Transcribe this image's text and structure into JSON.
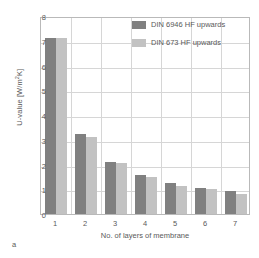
{
  "chart_data": {
    "type": "bar",
    "title": "",
    "categories": [
      "1",
      "2",
      "3",
      "4",
      "5",
      "6",
      "7"
    ],
    "series": [
      {
        "name": "DIN 6946 HF upwards",
        "color": "#808080",
        "values": [
          7.1,
          3.25,
          2.1,
          1.57,
          1.27,
          1.07,
          0.92
        ]
      },
      {
        "name": "DIN 673 HF upwards",
        "color": "#c2c2c2",
        "values": [
          7.1,
          3.1,
          2.05,
          1.48,
          1.15,
          1.0,
          0.82
        ]
      }
    ],
    "xlabel": "No. of layers of membrane",
    "ylabel": "U-value [W/m²K]",
    "ylabel_base": "U-value [W/m",
    "ylabel_sup": "2",
    "ylabel_tail": "K]",
    "ylim": [
      0,
      8
    ],
    "yticks": [
      0,
      1,
      2,
      3,
      4,
      5,
      6,
      7,
      8
    ],
    "ytick_labels": [
      "0",
      "1",
      "2",
      "3",
      "4",
      "5",
      "6",
      "7",
      "8"
    ],
    "grid": true,
    "legend_position": "top-right"
  },
  "caption": {
    "label": "a"
  }
}
